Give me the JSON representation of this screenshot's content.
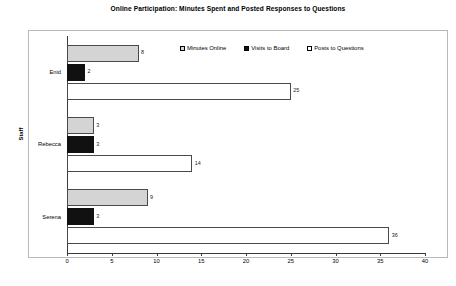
{
  "chart": {
    "title": "Online Participation: Minutes Spent and Posted Responses to Questions",
    "y_axis_title": "Staff"
  },
  "legend": {
    "items": [
      {
        "label": "Minutes Online",
        "swatch": "light-gray-square",
        "color": "#d4d4d4"
      },
      {
        "label": "Visits to Board",
        "swatch": "black-square",
        "color": "#111111"
      },
      {
        "label": "Posts to Questions",
        "swatch": "white-square",
        "color": "#ffffff"
      }
    ]
  },
  "chart_data": {
    "type": "bar",
    "orientation": "horizontal",
    "title": "Online Participation: Minutes Spent and Posted Responses to Questions",
    "xlabel": "",
    "ylabel": "Staff",
    "categories": [
      "Enid",
      "Rebecca",
      "Serena"
    ],
    "series": [
      {
        "name": "Minutes Online",
        "values": [
          8,
          3,
          9
        ],
        "color": "#d4d4d4"
      },
      {
        "name": "Visits to Board",
        "values": [
          2,
          3,
          3
        ],
        "color": "#111111"
      },
      {
        "name": "Posts to Questions",
        "values": [
          25,
          14,
          36
        ],
        "color": "#ffffff"
      }
    ],
    "xlim": [
      0,
      40
    ],
    "xticks": [
      0,
      5,
      10,
      15,
      20,
      25,
      30,
      35,
      40
    ],
    "xtick_labels": [
      "0",
      "5",
      "10",
      "15",
      "20",
      "25",
      "30",
      "35",
      "40"
    ],
    "grid": false,
    "legend_position": "top-center",
    "data_labels": true
  },
  "axis": {
    "ticks": [
      {
        "value": 0,
        "label": "0"
      },
      {
        "value": 5,
        "label": "5"
      },
      {
        "value": 10,
        "label": "10"
      },
      {
        "value": 15,
        "label": "15"
      },
      {
        "value": 20,
        "label": "20"
      },
      {
        "value": 25,
        "label": "25"
      },
      {
        "value": 30,
        "label": "30"
      },
      {
        "value": 35,
        "label": "35"
      },
      {
        "value": 40,
        "label": "40"
      }
    ]
  }
}
